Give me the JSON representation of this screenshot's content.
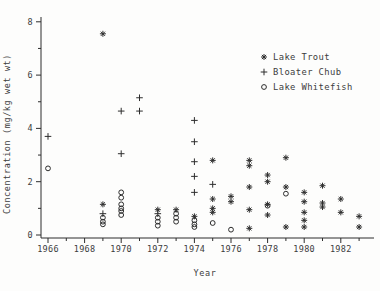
{
  "figure": {
    "background": "#fdfdfc",
    "ink": "#2d2d2d",
    "text_color": "#3c3c3c"
  },
  "chart_data": {
    "type": "scatter",
    "title": "",
    "xlabel": "Year",
    "ylabel": "Concentration (mg/kg wet wt)",
    "xlim": [
      1965.6,
      1983.8
    ],
    "ylim": [
      -0.1,
      8.15
    ],
    "x_major_ticks": [
      1966,
      1968,
      1970,
      1972,
      1974,
      1976,
      1978,
      1980,
      1982
    ],
    "x_minor_ticks": [
      1967,
      1969,
      1971,
      1973,
      1975,
      1977,
      1979,
      1981,
      1983
    ],
    "y_major_ticks": [
      0,
      2,
      4,
      6,
      8
    ],
    "y_minor_ticks": [
      1,
      3,
      5,
      7
    ],
    "grid": false,
    "legend": {
      "position": "upper-right",
      "entries": [
        {
          "marker": "asterisk",
          "label": "Lake Trout"
        },
        {
          "marker": "plus",
          "label": "Bloater Chub"
        },
        {
          "marker": "circle",
          "label": "Lake Whitefish"
        }
      ]
    },
    "series": [
      {
        "name": "Lake Trout",
        "marker": "asterisk",
        "points": [
          [
            1969,
            7.55
          ],
          [
            1969,
            1.15
          ],
          [
            1972,
            0.95
          ],
          [
            1973,
            0.95
          ],
          [
            1974,
            0.7
          ],
          [
            1975,
            2.8
          ],
          [
            1975,
            1.35
          ],
          [
            1975,
            1.0
          ],
          [
            1975,
            0.85
          ],
          [
            1976,
            1.45
          ],
          [
            1976,
            1.25
          ],
          [
            1977,
            2.8
          ],
          [
            1977,
            2.6
          ],
          [
            1977,
            1.8
          ],
          [
            1977,
            0.95
          ],
          [
            1977,
            0.25
          ],
          [
            1978,
            2.25
          ],
          [
            1978,
            2.0
          ],
          [
            1978,
            1.15
          ],
          [
            1978,
            0.75
          ],
          [
            1979,
            2.9
          ],
          [
            1979,
            1.8
          ],
          [
            1979,
            0.3
          ],
          [
            1980,
            1.6
          ],
          [
            1980,
            1.25
          ],
          [
            1980,
            0.85
          ],
          [
            1980,
            0.55
          ],
          [
            1980,
            0.3
          ],
          [
            1981,
            1.85
          ],
          [
            1981,
            1.2
          ],
          [
            1981,
            1.05
          ],
          [
            1982,
            1.35
          ],
          [
            1982,
            0.85
          ],
          [
            1983,
            0.7
          ],
          [
            1983,
            0.3
          ]
        ]
      },
      {
        "name": "Bloater Chub",
        "marker": "plus",
        "points": [
          [
            1966,
            3.7
          ],
          [
            1969,
            0.8
          ],
          [
            1970,
            4.65
          ],
          [
            1970,
            3.05
          ],
          [
            1971,
            5.15
          ],
          [
            1971,
            4.65
          ],
          [
            1972,
            0.8
          ],
          [
            1974,
            4.3
          ],
          [
            1974,
            3.5
          ],
          [
            1974,
            2.75
          ],
          [
            1974,
            2.2
          ],
          [
            1974,
            1.6
          ],
          [
            1975,
            1.9
          ]
        ]
      },
      {
        "name": "Lake Whitefish",
        "marker": "circle",
        "points": [
          [
            1966,
            2.5
          ],
          [
            1969,
            0.65
          ],
          [
            1969,
            0.5
          ],
          [
            1969,
            0.4
          ],
          [
            1970,
            1.6
          ],
          [
            1970,
            1.4
          ],
          [
            1970,
            1.15
          ],
          [
            1970,
            1.0
          ],
          [
            1970,
            0.9
          ],
          [
            1970,
            0.75
          ],
          [
            1972,
            0.65
          ],
          [
            1972,
            0.5
          ],
          [
            1972,
            0.35
          ],
          [
            1973,
            0.8
          ],
          [
            1973,
            0.65
          ],
          [
            1973,
            0.5
          ],
          [
            1974,
            0.55
          ],
          [
            1974,
            0.4
          ],
          [
            1974,
            0.3
          ],
          [
            1975,
            0.45
          ],
          [
            1976,
            0.2
          ],
          [
            1978,
            1.1
          ],
          [
            1979,
            1.55
          ]
        ]
      }
    ]
  }
}
